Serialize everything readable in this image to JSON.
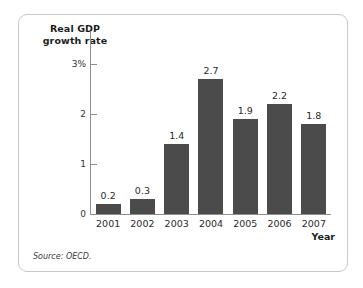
{
  "figure": {
    "source_note": "Source: OECD."
  },
  "chart_data": {
    "type": "bar",
    "title": "",
    "categories": [
      "2001",
      "2002",
      "2003",
      "2004",
      "2005",
      "2006",
      "2007"
    ],
    "values": [
      0.2,
      0.3,
      1.4,
      2.7,
      1.9,
      2.2,
      1.8
    ],
    "value_labels": [
      "0.2",
      "0.3",
      "1.4",
      "2.7",
      "1.9",
      "2.2",
      "1.8"
    ],
    "xlabel": "Year",
    "ylabel": "Real GDP growth rate",
    "ylabel_line1": "Real GDP",
    "ylabel_line2": "growth rate",
    "ylim": [
      0,
      3.35
    ],
    "yticks": [
      0,
      1,
      2,
      3
    ],
    "ytick_labels": [
      "0",
      "1",
      "2",
      "3%"
    ],
    "grid": false,
    "legend": false,
    "bar_color": "#4b4b4b",
    "axis_color": "#8e8e8e"
  }
}
